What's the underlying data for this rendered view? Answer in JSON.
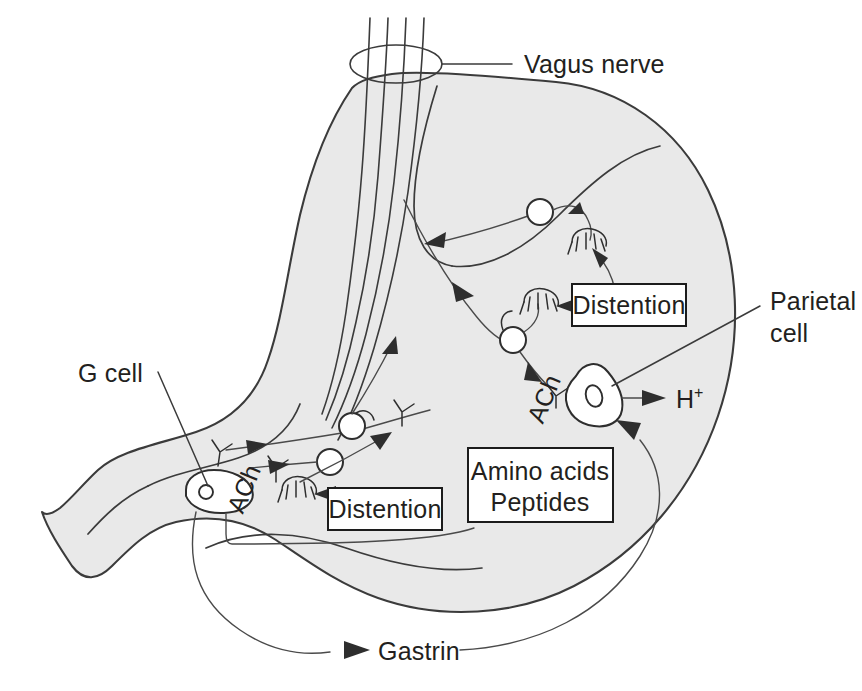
{
  "figure": {
    "background_color": "#ffffff",
    "organ_fill_color": "#e9e9e9",
    "stroke_color": "#3b3b3b",
    "text_color": "#231f20"
  },
  "labels": {
    "vagus_nerve": "Vagus nerve",
    "parietal_cell_line1": "Parietal",
    "parietal_cell_line2": "cell",
    "g_cell": "G cell",
    "gastrin": "Gastrin",
    "distention_upper": "Distention",
    "distention_lower": "Distention",
    "amino_acids": "Amino acids",
    "peptides": "Peptides",
    "ach_parietal": "ACh",
    "ach_gcell": "ACh",
    "hydrogen_ion": "H",
    "hydrogen_ion_charge": "+"
  },
  "structures": {
    "vagus_fiber_count": 4,
    "neuron_count": 4,
    "receptor_count": 3,
    "secretory_cells": [
      "parietal cell",
      "G cell"
    ]
  }
}
